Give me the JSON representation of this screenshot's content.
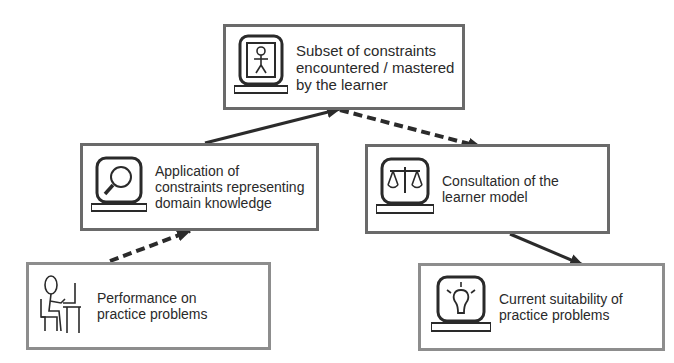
{
  "diagram": {
    "nodes": [
      {
        "id": "top",
        "icon": "learner-monitor-icon",
        "label": "Subset of constraints encountered / mastered by the learner"
      },
      {
        "id": "mid_left",
        "icon": "magnifier-monitor-icon",
        "label": "Application of constraints representing domain knowledge"
      },
      {
        "id": "mid_right",
        "icon": "scales-monitor-icon",
        "label": "Consultation of the learner model"
      },
      {
        "id": "bottom_left",
        "icon": "person-at-computer-icon",
        "label": "Performance on practice problems"
      },
      {
        "id": "bottom_right",
        "icon": "lightbulb-monitor-icon",
        "label": "Current suitability of practice problems"
      }
    ],
    "edges": [
      {
        "from": "bottom_left",
        "to": "mid_left",
        "style": "dashed"
      },
      {
        "from": "mid_left",
        "to": "top",
        "style": "solid"
      },
      {
        "from": "top",
        "to": "mid_right",
        "style": "dashed"
      },
      {
        "from": "mid_right",
        "to": "bottom_right",
        "style": "solid"
      }
    ],
    "colors": {
      "border": "#6a6a6a",
      "border_light": "#8d8d8d",
      "arrow": "#2b2b2b",
      "text": "#2a2a2a"
    }
  }
}
